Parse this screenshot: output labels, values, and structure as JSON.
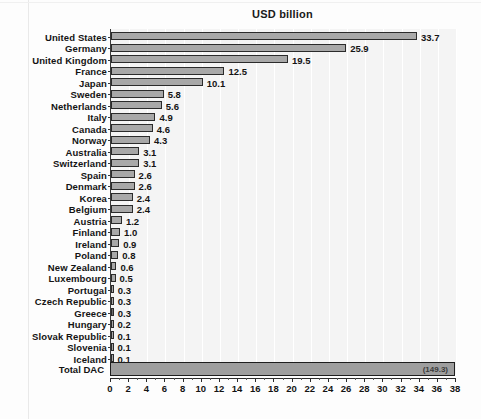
{
  "chart_data": {
    "type": "bar",
    "orientation": "horizontal",
    "title": "USD billion",
    "xlabel": "",
    "ylabel": "",
    "xlim": [
      0,
      38
    ],
    "xticks": [
      0,
      2,
      4,
      6,
      8,
      10,
      12,
      14,
      16,
      18,
      20,
      22,
      24,
      26,
      28,
      30,
      32,
      34,
      36,
      38
    ],
    "grid": true,
    "grid_axis": "x",
    "legend": null,
    "categories": [
      "United States",
      "Germany",
      "United Kingdom",
      "France",
      "Japan",
      "Sweden",
      "Netherlands",
      "Italy",
      "Canada",
      "Norway",
      "Australia",
      "Switzerland",
      "Spain",
      "Denmark",
      "Korea",
      "Belgium",
      "Austria",
      "Finland",
      "Ireland",
      "Poland",
      "New Zealand",
      "Luxembourg",
      "Portugal",
      "Czech Republic",
      "Greece",
      "Hungary",
      "Slovak Republic",
      "Slovenia",
      "Iceland"
    ],
    "values": [
      33.7,
      25.9,
      19.5,
      12.5,
      10.1,
      5.8,
      5.6,
      4.9,
      4.6,
      4.3,
      3.1,
      3.1,
      2.6,
      2.6,
      2.4,
      2.4,
      1.2,
      1.0,
      0.9,
      0.8,
      0.6,
      0.5,
      0.3,
      0.3,
      0.3,
      0.2,
      0.1,
      0.1,
      0.1
    ],
    "value_labels": [
      "33.7",
      "25.9",
      "19.5",
      "12.5",
      "10.1",
      "5.8",
      "5.6",
      "4.9",
      "4.6",
      "4.3",
      "3.1",
      "3.1",
      "2.6",
      "2.6",
      "2.4",
      "2.4",
      "1.2",
      "1.0",
      "0.9",
      "0.8",
      "0.6",
      "0.5",
      "0.3",
      "0.3",
      "0.3",
      "0.2",
      "0.1",
      "0.1",
      "0.1"
    ],
    "total": {
      "category": "Total DAC",
      "value": 149.3,
      "value_label": "(149.3)",
      "note": "bar drawn full axis width; actual value exceeds axis maximum"
    },
    "colors": {
      "bar_fill": "#a8a8a8",
      "bar_edge": "#2b2b2b",
      "plot_background": "#f4f4f4",
      "gridline": "#ffffff",
      "text": "#141414"
    }
  }
}
